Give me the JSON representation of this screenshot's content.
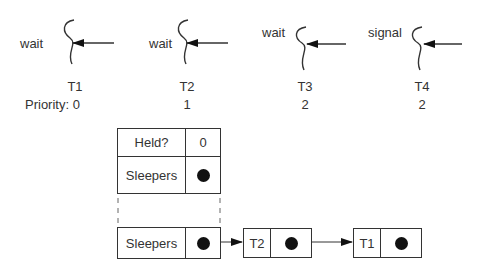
{
  "threads": [
    {
      "name": "T1",
      "op": "wait",
      "priority": "0"
    },
    {
      "name": "T2",
      "op": "wait",
      "priority": "1"
    },
    {
      "name": "T3",
      "op": "wait",
      "priority": "2"
    },
    {
      "name": "T4",
      "op": "signal",
      "priority": "2"
    }
  ],
  "priority_label": "Priority: 0",
  "lock": {
    "held_label": "Held?",
    "held_value": "0",
    "sleepers_label": "Sleepers"
  },
  "queue": {
    "head_label": "Sleepers",
    "nodes": [
      {
        "label": "T2"
      },
      {
        "label": "T1"
      }
    ]
  }
}
